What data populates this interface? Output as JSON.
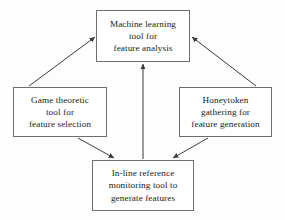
{
  "diagram": {
    "background_color": "#fdfdfd",
    "border_color": "#6e6e6e",
    "text_color": "#1a1a1a",
    "arrow_color": "#3a3a3a",
    "nodes": [
      {
        "id": "ml",
        "name": "machine-learning-tool",
        "lines": [
          "Machine learning",
          "tool for",
          "feature analysis"
        ]
      },
      {
        "id": "game",
        "name": "game-theoretic-tool",
        "lines": [
          "Game theoretic",
          "tool for",
          "feature selection"
        ]
      },
      {
        "id": "honey",
        "name": "honeytoken-gathering",
        "lines": [
          "Honeytoken",
          "gathering for",
          "feature generation"
        ]
      },
      {
        "id": "inline",
        "name": "in-line-reference-monitoring-tool",
        "lines": [
          "In-line reference",
          "monitoring tool to",
          "generate features"
        ]
      }
    ],
    "edges": [
      {
        "name": "edge-game-to-ml",
        "from": "game",
        "to": "ml",
        "style": "arrow"
      },
      {
        "name": "edge-honeytoken-to-ml",
        "from": "honey",
        "to": "ml",
        "style": "arrow"
      },
      {
        "name": "edge-inline-to-ml",
        "from": "inline",
        "to": "ml",
        "style": "arrow"
      },
      {
        "name": "edge-game-to-inline",
        "from": "game",
        "to": "inline",
        "style": "arrow"
      },
      {
        "name": "edge-honeytoken-to-inline",
        "from": "honey",
        "to": "inline",
        "style": "arrow"
      }
    ]
  }
}
